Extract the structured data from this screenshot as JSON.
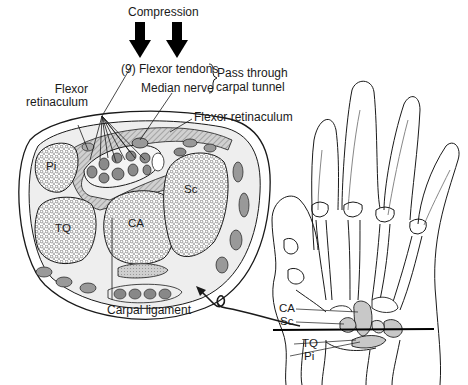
{
  "figure": {
    "compression_label": "Compression",
    "flexor_tendons_label": "(9) Flexor tendons",
    "median_nerve_label": "Median nerve",
    "pass_through_line1": "Pass through",
    "pass_through_line2": "carpal tunnel",
    "flexor_retinaculum_left_line1": "Flexor",
    "flexor_retinaculum_left_line2": "retinaculum",
    "flexor_retinaculum_right": "Flexor retinaculum",
    "carpal_ligament_label": "Carpal ligament",
    "cross_section_bones": {
      "pi": "Pi",
      "tq": "TQ",
      "ca": "CA",
      "sc": "Sc"
    },
    "hand_labels": {
      "ca": "CA",
      "sc": "Sc",
      "tq": "TQ",
      "pi": "Pi"
    },
    "colors": {
      "line": "#1a1a1a",
      "bone_fill": "#ffffff",
      "shade": "#bdbdbd",
      "tendon_fill": "#8a8a8a",
      "hand_shade": "#c8c8c8"
    }
  }
}
